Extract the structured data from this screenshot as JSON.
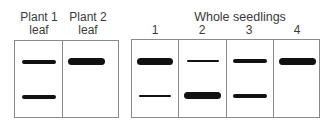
{
  "left_panel": {
    "lanes": [
      {
        "label_line1": "Plant 1",
        "label_line2": "leaf"
      },
      {
        "label_line1": "Plant 2",
        "label_line2": "leaf"
      }
    ]
  },
  "right_panel": {
    "title": "Whole seedlings",
    "lanes": [
      {
        "label": "1"
      },
      {
        "label": "2"
      },
      {
        "label": "3"
      },
      {
        "label": "4"
      }
    ]
  },
  "bands": {
    "plant1_leaf": {
      "upper": "medium",
      "lower": "medium"
    },
    "plant2_leaf": {
      "upper": "thick",
      "lower": "none"
    },
    "seedling1": {
      "upper": "thick",
      "lower": "thin"
    },
    "seedling2": {
      "upper": "thin",
      "lower": "thick"
    },
    "seedling3": {
      "upper": "medium",
      "lower": "medium"
    },
    "seedling4": {
      "upper": "thick",
      "lower": "none"
    }
  }
}
